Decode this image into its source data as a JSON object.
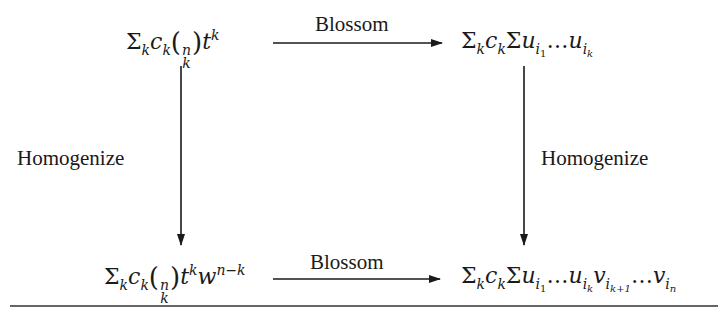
{
  "diagram": {
    "type": "commutative-diagram",
    "nodes": {
      "top_left": "Σ_k c_k (n choose k) t^k",
      "top_right": "Σ_k c_k Σ u_{i_1} … u_{i_k}",
      "bottom_left": "Σ_k c_k (n choose k) t^k w^{n−k}",
      "bottom_right": "Σ_k c_k Σ u_{i_1} … u_{i_k} v_{i_{k+1}} … v_{i_n}"
    },
    "edges": {
      "top": {
        "from": "top_left",
        "to": "top_right",
        "label": "Blossom"
      },
      "bottom": {
        "from": "bottom_left",
        "to": "bottom_right",
        "label": "Blossom"
      },
      "left": {
        "from": "top_left",
        "to": "bottom_left",
        "label": "Homogenize"
      },
      "right": {
        "from": "top_right",
        "to": "bottom_right",
        "label": "Homogenize"
      }
    },
    "glyphs": {
      "sigma": "Σ",
      "c": "c",
      "k": "k",
      "n": "n",
      "t": "t",
      "w": "w",
      "u": "u",
      "v": "v",
      "i": "i",
      "ellipsis": "…",
      "lparen": "(",
      "rparen": ")",
      "one": "1",
      "n_minus_k": "n−k",
      "k_plus_1": "k+1"
    }
  }
}
